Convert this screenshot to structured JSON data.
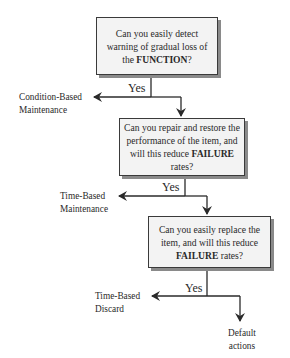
{
  "diagram": {
    "type": "decision-flowchart",
    "nodes": [
      {
        "id": "q1",
        "pre": "Can you easily detect warning of gradual loss of the ",
        "bold": "FUNCTION",
        "post": "?"
      },
      {
        "id": "q2",
        "pre": "Can you repair and restore the performance of the item, and will this reduce ",
        "bold": "FAILURE",
        "post": " rates?"
      },
      {
        "id": "q3",
        "pre": "Can you easily replace the item, and will this reduce ",
        "bold": "FAILURE",
        "post": " rates?"
      }
    ],
    "edges": [
      {
        "from": "q1",
        "label": "Yes",
        "to": "Condition-Based Maintenance"
      },
      {
        "from": "q1",
        "label": "",
        "to": "q2"
      },
      {
        "from": "q2",
        "label": "Yes",
        "to": "Time-Based Maintenance"
      },
      {
        "from": "q2",
        "label": "",
        "to": "q3"
      },
      {
        "from": "q3",
        "label": "Yes",
        "to": "Time-Based Discard"
      },
      {
        "from": "q3",
        "label": "",
        "to": "Default actions"
      }
    ],
    "yes_label": "Yes",
    "outcomes": {
      "cbm": {
        "line1": "Condition-Based",
        "line2": "Maintenance"
      },
      "tbm": {
        "line1": "Time-Based",
        "line2": "Maintenance"
      },
      "tbd": {
        "line1": "Time-Based",
        "line2": "Discard"
      },
      "default": {
        "line1": "Default",
        "line2": "actions"
      }
    },
    "colors": {
      "line": "#2a2a2a",
      "box_fill": "#f3f3f3",
      "box_border": "#3a3a3a",
      "shadow": "#8a8a8a"
    }
  }
}
